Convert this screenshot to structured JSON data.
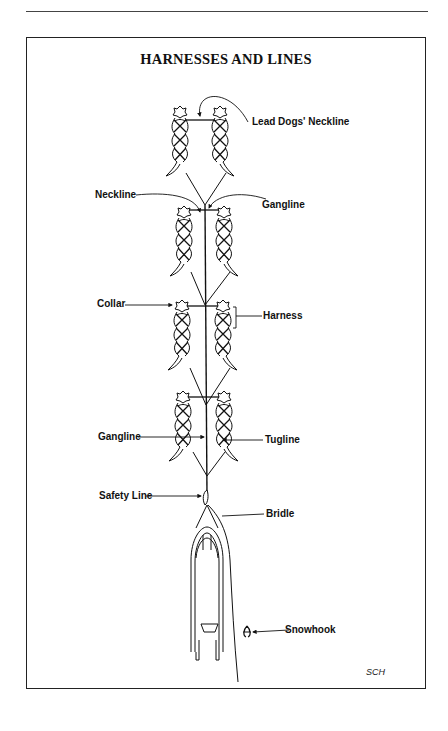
{
  "figure": {
    "title": "HARNESSES AND LINES",
    "credit": "SCH",
    "labels": {
      "lead_dogs_neckline": "Lead Dogs' Neckline",
      "neckline": "Neckline",
      "gangline_top": "Gangline",
      "collar": "Collar",
      "harness": "Harness",
      "gangline_lower": "Gangline",
      "tugline": "Tugline",
      "safety_line": "Safety Line",
      "bridle": "Bridle",
      "snowhook": "Snowhook"
    },
    "components": [
      "lead-dog-pair",
      "dog-pair-2",
      "dog-pair-3",
      "dog-pair-4",
      "sled",
      "snowhook"
    ],
    "colors": {
      "ink": "#111111",
      "frame": "#222222",
      "background": "#ffffff"
    }
  }
}
